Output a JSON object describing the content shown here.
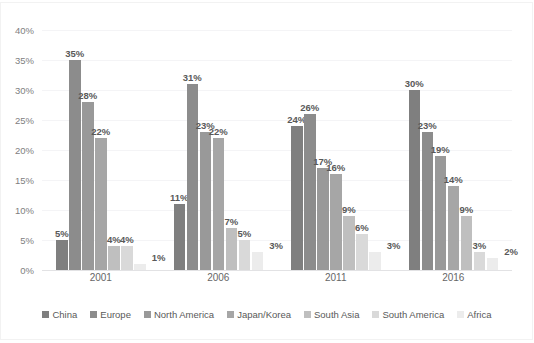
{
  "chart_data": {
    "type": "bar",
    "title": "",
    "xlabel": "",
    "ylabel": "",
    "categories": [
      "2001",
      "2006",
      "2011",
      "2016"
    ],
    "ylim": [
      0,
      40
    ],
    "ytick_labels": [
      "0%",
      "5%",
      "10%",
      "15%",
      "20%",
      "25%",
      "30%",
      "35%",
      "40%"
    ],
    "ytick_values": [
      0,
      5,
      10,
      15,
      20,
      25,
      30,
      35,
      40
    ],
    "grid": true,
    "legend_position": "bottom",
    "value_suffix": "%",
    "series": [
      {
        "name": "China",
        "color": "#7f7f7f",
        "values": [
          5,
          11,
          24,
          30
        ],
        "labels": [
          "5%",
          "11%",
          "24%",
          "30%"
        ]
      },
      {
        "name": "Europe",
        "color": "#8c8c8c",
        "values": [
          35,
          31,
          26,
          23
        ],
        "labels": [
          "35%",
          "31%",
          "26%",
          "23%"
        ]
      },
      {
        "name": "North America",
        "color": "#999999",
        "values": [
          28,
          23,
          17,
          19
        ],
        "labels": [
          "28%",
          "23%",
          "17%",
          "19%"
        ]
      },
      {
        "name": "Japan/Korea",
        "color": "#a6a6a6",
        "values": [
          22,
          22,
          16,
          14
        ],
        "labels": [
          "22%",
          "22%",
          "16%",
          "14%"
        ]
      },
      {
        "name": "South Asia",
        "color": "#bfbfbf",
        "values": [
          4,
          7,
          9,
          9
        ],
        "labels": [
          "4%",
          "7%",
          "9%",
          "9%"
        ]
      },
      {
        "name": "South America",
        "color": "#d9d9d9",
        "values": [
          4,
          5,
          6,
          3
        ],
        "labels": [
          "4%",
          "5%",
          "6%",
          "3%"
        ]
      },
      {
        "name": "Africa",
        "color": "#ececec",
        "values": [
          1,
          3,
          3,
          2
        ],
        "labels": [
          "1%",
          "3%",
          "3%",
          "2%"
        ]
      }
    ]
  }
}
